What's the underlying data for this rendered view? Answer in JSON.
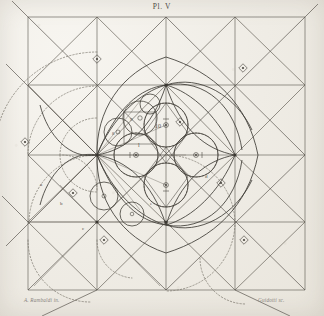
{
  "plate": {
    "title": "Pl. V",
    "paper_color": "#efece5",
    "ink_color": "#3b3832",
    "faint_ink_color": "#8c887f"
  },
  "credits": {
    "left": "A. Rambaldi  in.",
    "right": "Guidotti sc."
  },
  "figure": {
    "type": "geometric-construction-plate",
    "grid": {
      "x_lines": [
        28,
        97,
        166,
        235,
        305
      ],
      "y_lines": [
        17,
        85,
        155,
        222,
        290
      ],
      "columns": 4,
      "rows": 4
    },
    "center": {
      "x": 166,
      "y": 155
    },
    "rosette_circles": [
      {
        "id": "c-top",
        "cx": 166,
        "cy": 125,
        "r": 22,
        "label": "10"
      },
      {
        "id": "c-right",
        "cx": 196,
        "cy": 155,
        "r": 22,
        "label": ""
      },
      {
        "id": "c-bottom",
        "cx": 166,
        "cy": 185,
        "r": 22,
        "label": ""
      },
      {
        "id": "c-left",
        "cx": 136,
        "cy": 155,
        "r": 22,
        "label": "l"
      }
    ],
    "satellite_circles": [
      {
        "id": "s-upper",
        "cx": 140,
        "cy": 118,
        "r": 17,
        "label": "9"
      },
      {
        "id": "s-upper-left",
        "cx": 118,
        "cy": 132,
        "r": 14,
        "label": "8"
      },
      {
        "id": "s-lower-left",
        "cx": 104,
        "cy": 196,
        "r": 14,
        "label": "7"
      },
      {
        "id": "s-lower",
        "cx": 132,
        "cy": 214,
        "r": 12,
        "label": "6"
      }
    ],
    "point_markers": [
      {
        "x": 97,
        "y": 59
      },
      {
        "x": 243,
        "y": 68
      },
      {
        "x": 25,
        "y": 142
      },
      {
        "x": 73,
        "y": 193
      },
      {
        "x": 104,
        "y": 240
      },
      {
        "x": 244,
        "y": 240
      },
      {
        "x": 221,
        "y": 183
      },
      {
        "x": 180,
        "y": 122
      }
    ],
    "labels": [
      {
        "text": "10",
        "x": 158,
        "y": 128
      },
      {
        "text": "l",
        "x": 138,
        "y": 148
      },
      {
        "text": "9",
        "x": 131,
        "y": 122
      },
      {
        "text": "8",
        "x": 113,
        "y": 136
      },
      {
        "text": "a",
        "x": 40,
        "y": 186
      },
      {
        "text": "b",
        "x": 60,
        "y": 205
      },
      {
        "text": "c",
        "x": 82,
        "y": 230
      },
      {
        "text": "d",
        "x": 205,
        "y": 178
      },
      {
        "text": "e",
        "x": 150,
        "y": 205
      }
    ],
    "dotted_arcs": true,
    "diagonals": true
  }
}
